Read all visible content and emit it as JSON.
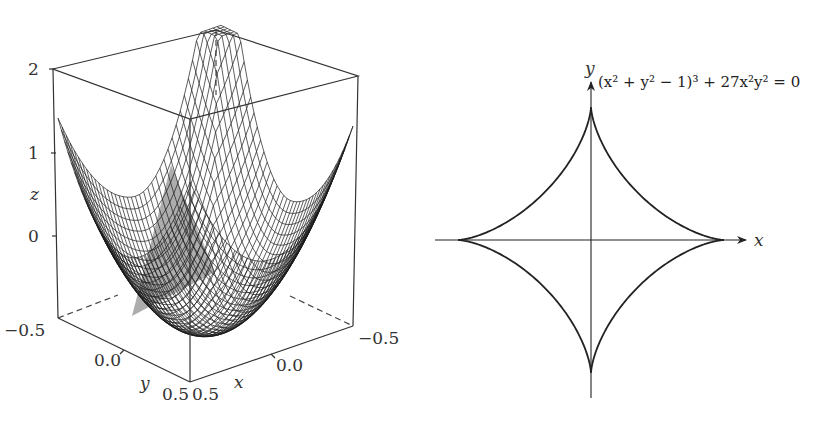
{
  "chart_data": [
    {
      "type": "surface3d",
      "title": "",
      "description": "3D wireframe surface plot of a bowl-shaped surface with a sharp peak at the back corner",
      "xlabel": "x",
      "ylabel": "y",
      "zlabel": "z",
      "x_ticks": [
        "0.5",
        "0.0",
        "−0.5"
      ],
      "y_ticks": [
        "−0.5",
        "0.0",
        "0.5"
      ],
      "z_ticks": [
        "0",
        "1",
        "2"
      ],
      "xlim": [
        -0.5,
        0.5
      ],
      "ylim": [
        -0.5,
        0.5
      ],
      "zlim": [
        -0.5,
        2
      ],
      "grid": false,
      "style": "black mesh on white with gray-shaded interior triangle"
    },
    {
      "type": "line",
      "title": "",
      "curve": "astroid",
      "equation": "(x² + y² − 1)³ + 27x²y² = 0",
      "xlabel": "x",
      "ylabel": "y",
      "xlim": [
        -1.1,
        1.15
      ],
      "ylim": [
        -1.2,
        1.2
      ],
      "cusps": [
        [
          1,
          0
        ],
        [
          0,
          1
        ],
        [
          -1,
          0
        ],
        [
          0,
          -1
        ]
      ],
      "grid": false,
      "axes_through_origin": true
    }
  ],
  "left": {
    "z_ticks": [
      {
        "label": "2",
        "y": 75
      },
      {
        "label": "1",
        "y": 159
      },
      {
        "label": "0",
        "y": 242
      }
    ],
    "z_label": "z",
    "y_ticks": [
      {
        "label": "−0.5",
        "x": 4,
        "y": 336
      },
      {
        "label": "0.0",
        "x": 94,
        "y": 366
      },
      {
        "label": "0.5",
        "x": 162,
        "y": 400
      }
    ],
    "y_label": "y",
    "x_ticks": [
      {
        "label": "0.5",
        "x": 192,
        "y": 400
      },
      {
        "label": "0.0",
        "x": 276,
        "y": 371
      },
      {
        "label": "−0.5",
        "x": 358,
        "y": 344
      }
    ],
    "x_label": "x"
  },
  "right": {
    "equation": "(x² + y² − 1)³ + 27x²y² = 0",
    "x_label": "x",
    "y_label": "y"
  }
}
